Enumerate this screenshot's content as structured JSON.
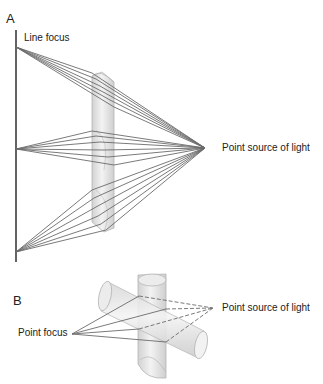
{
  "panel_a": {
    "letter": "A",
    "line_focus_label": "Line focus",
    "point_source_label": "Point source of light",
    "point_source": [
      205,
      148
    ],
    "focus_line": {
      "x": 16,
      "y_top": 30,
      "y_bottom": 262
    },
    "focus_points": [
      [
        16,
        47
      ],
      [
        16,
        149
      ],
      [
        16,
        252
      ]
    ],
    "cylinder": {
      "x": 92,
      "y_top": 70,
      "width": 22,
      "height": 160
    }
  },
  "panel_b": {
    "letter": "B",
    "point_focus_label": "Point focus",
    "point_source_label": "Point source of light",
    "point_focus": [
      72,
      334
    ],
    "point_source": [
      213,
      308
    ]
  },
  "colors": {
    "ray": "#6b6b6b",
    "cylinder_fill": "#e4e4e4",
    "cylinder_edge": "#b8b8b8",
    "text": "#222222"
  }
}
